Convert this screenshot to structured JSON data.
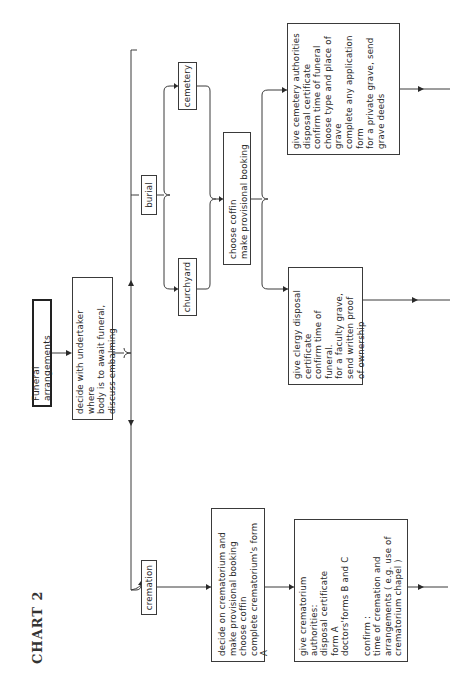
{
  "chart_title": "CHART 2",
  "nodes": {
    "start": "Funeral arrangements",
    "decide_undertaker": "decide with undertaker where\nbody is to await funeral,\ndiscuss embalming",
    "cremation": "cremation",
    "burial": "burial",
    "churchyard": "churchyard",
    "cemetery": "cemetery",
    "choose_coffin": "choose coffin\nmake provisional booking",
    "decide_crematorium": "decide on crematorium and\nmake provisional booking\nchoose coffin\ncomplete crematorium's form A",
    "crematorium_authorities": "give crematorium authorities:\ndisposal certificate\nform A\ndoctors'forms B and C\n\nconfirm :\ntime of cremation and\narrangements ( e.g. use of\ncrematorium chapel )",
    "clergy": "give clergy disposal\ncertificate\nconfirm time of funeral.\nfor a faculty grave,\nsend written proof\nof ownership",
    "cemetery_authorities": "give cemetery authorities\ndisposal certificate\nconfirm time of funeral\nchoose type and place of\ngrave\ncomplete any application\nform\nfor a private grave, send\ngrave deeds"
  },
  "colors": {
    "ink": "#2a2a2a",
    "background": "#ffffff"
  }
}
